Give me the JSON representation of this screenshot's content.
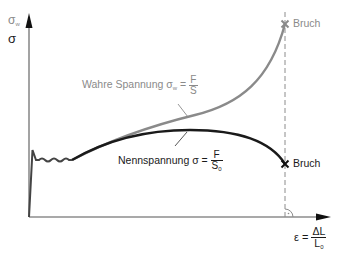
{
  "diagram": {
    "type": "stress-strain",
    "y_axis": {
      "label_top": "σ",
      "label_top_sub": "w",
      "label_bottom": "σ"
    },
    "x_axis": {
      "label_prefix": "ε =",
      "frac_num": "ΔL",
      "frac_den": "L",
      "frac_den_sub": "0"
    },
    "curves": {
      "true_stress": {
        "label": "Wahre Spannung σ",
        "label_sub": "w",
        "equals": "=",
        "frac_num": "F",
        "frac_den": "S",
        "color": "#8a8a8a"
      },
      "nominal_stress": {
        "label": "Nennspannung σ =",
        "frac_num": "F",
        "frac_den": "S",
        "frac_den_sub": "0",
        "color": "#1a1a1a"
      }
    },
    "fracture_top": {
      "label": "Bruch",
      "marker": "×"
    },
    "fracture_bottom": {
      "label": "Bruch",
      "marker": "×"
    }
  }
}
